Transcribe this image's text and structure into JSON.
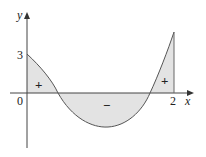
{
  "diagram": {
    "axes": {
      "x_label": "x",
      "y_label": "y",
      "origin_label": "0",
      "x_tick_label": "2",
      "y_tick_label": "3"
    },
    "regions": [
      {
        "sign": "+",
        "position": "left, above axis"
      },
      {
        "sign": "−",
        "position": "middle, below axis"
      },
      {
        "sign": "+",
        "position": "right, above axis"
      }
    ],
    "colors": {
      "fill": "#e3e3e3",
      "stroke": "#555555",
      "axis": "#444444"
    }
  }
}
